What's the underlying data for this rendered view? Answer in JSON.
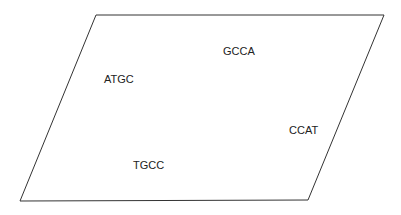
{
  "diagram": {
    "shape": "parallelogram",
    "points": [
      [
        96,
        15
      ],
      [
        384,
        15
      ],
      [
        308,
        200
      ],
      [
        20,
        201
      ]
    ],
    "stroke_color": "#333333",
    "fill_color": "#ffffff"
  },
  "labels": [
    {
      "text": "ATGC",
      "x": 104,
      "y": 73
    },
    {
      "text": "GCCA",
      "x": 223,
      "y": 45
    },
    {
      "text": "CCAT",
      "x": 289,
      "y": 124
    },
    {
      "text": "TGCC",
      "x": 133,
      "y": 159
    }
  ]
}
